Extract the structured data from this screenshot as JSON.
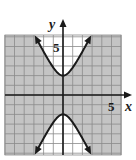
{
  "chart_data": {
    "type": "line",
    "title": "",
    "xlabel": "x",
    "ylabel": "y",
    "xlim": [
      -6,
      6
    ],
    "ylim": [
      -6.2,
      6.2
    ],
    "grid": true,
    "tick_labels": {
      "x": [
        "5"
      ],
      "y": [
        "5"
      ]
    },
    "equation": "y^2/4 - x^2 = 1",
    "shaded_region": "y^2/4 - x^2 <= 1 (region between the branches is shaded gray)",
    "series": [
      {
        "name": "upper branch",
        "x": [
          -2.9,
          -2,
          -1,
          0,
          1,
          2,
          2.9
        ],
        "y": [
          6.13,
          4.47,
          2.83,
          2,
          2.83,
          4.47,
          6.13
        ]
      },
      {
        "name": "lower branch",
        "x": [
          -2.9,
          -2,
          -1,
          0,
          1,
          2,
          2.9
        ],
        "y": [
          -6.13,
          -4.47,
          -2.83,
          -2,
          -2.83,
          -4.47,
          -6.13
        ]
      }
    ],
    "vertices": [
      [
        0,
        2
      ],
      [
        0,
        -2
      ]
    ]
  },
  "colors": {
    "shade": "#c4c4c4",
    "grid": "#8a8a8a",
    "curve": "#1a1a1a",
    "background": "#ffffff"
  }
}
